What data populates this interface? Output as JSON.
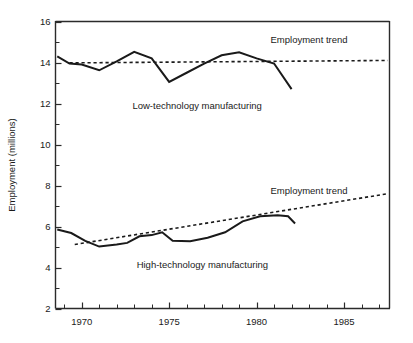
{
  "chart_data": {
    "type": "line",
    "title": "",
    "xlabel": "",
    "ylabel": "Employment (millions)",
    "xlim": [
      1968.5,
      1987.6
    ],
    "ylim": [
      2,
      16
    ],
    "grid": false,
    "legend_position": "inline-annotations",
    "y_ticks": [
      2,
      4,
      6,
      8,
      10,
      12,
      14,
      16
    ],
    "y_tick_labels": [
      "2",
      "4",
      "6",
      "8",
      "10",
      "12",
      "14",
      "16"
    ],
    "y_minor_ticks": [
      3,
      5,
      7,
      9,
      11,
      13,
      15
    ],
    "x_ticks": [
      1970,
      1975,
      1980,
      1985
    ],
    "x_tick_labels": [
      "1970",
      "1975",
      "1980",
      "1985"
    ],
    "x_minor_ticks": [
      1969,
      1971,
      1972,
      1973,
      1974,
      1976,
      1977,
      1978,
      1979,
      1981,
      1982,
      1983,
      1984,
      1986,
      1987
    ],
    "series": [
      {
        "name": "Low-technology manufacturing",
        "style": "solid",
        "x": [
          1968.6,
          1969.3,
          1970.0,
          1971.0,
          1972.0,
          1973.0,
          1974.0,
          1975.0,
          1976.0,
          1977.0,
          1978.0,
          1979.0,
          1980.0,
          1981.0,
          1982.0
        ],
        "values": [
          14.3,
          13.95,
          13.9,
          13.62,
          14.05,
          14.52,
          14.2,
          13.05,
          13.5,
          13.95,
          14.35,
          14.5,
          14.2,
          13.95,
          12.7
        ]
      },
      {
        "name": "Low-technology employment trend",
        "style": "dashed",
        "x": [
          1969.3,
          1987.5
        ],
        "values": [
          13.98,
          14.1
        ]
      },
      {
        "name": "High-technology manufacturing",
        "style": "solid",
        "x": [
          1968.6,
          1969.4,
          1970.2,
          1971.0,
          1972.0,
          1972.6,
          1973.3,
          1974.0,
          1974.6,
          1975.2,
          1976.2,
          1977.2,
          1978.2,
          1979.2,
          1980.2,
          1981.2,
          1981.8,
          1982.2
        ],
        "values": [
          5.85,
          5.68,
          5.3,
          5.02,
          5.12,
          5.2,
          5.52,
          5.58,
          5.72,
          5.3,
          5.28,
          5.45,
          5.72,
          6.25,
          6.5,
          6.55,
          6.5,
          6.15
        ]
      },
      {
        "name": "High-technology employment trend",
        "style": "dashed",
        "x": [
          1969.6,
          1987.5
        ],
        "values": [
          5.12,
          7.6
        ]
      }
    ],
    "annotations": [
      {
        "text": "Employment trend",
        "x": 1983.0,
        "y": 14.95,
        "ref": "low-technology"
      },
      {
        "text": "Low-technology manufacturing",
        "x": 1976.6,
        "y": 11.75,
        "ref": "low-technology"
      },
      {
        "text": "Employment trend",
        "x": 1983.0,
        "y": 7.6,
        "ref": "high-technology"
      },
      {
        "text": "High-technology manufacturing",
        "x": 1976.9,
        "y": 4.0,
        "ref": "high-technology"
      }
    ],
    "colors": {
      "line": "#1a1a1a",
      "axis": "#2b2b2b",
      "background": "#ffffff"
    }
  }
}
